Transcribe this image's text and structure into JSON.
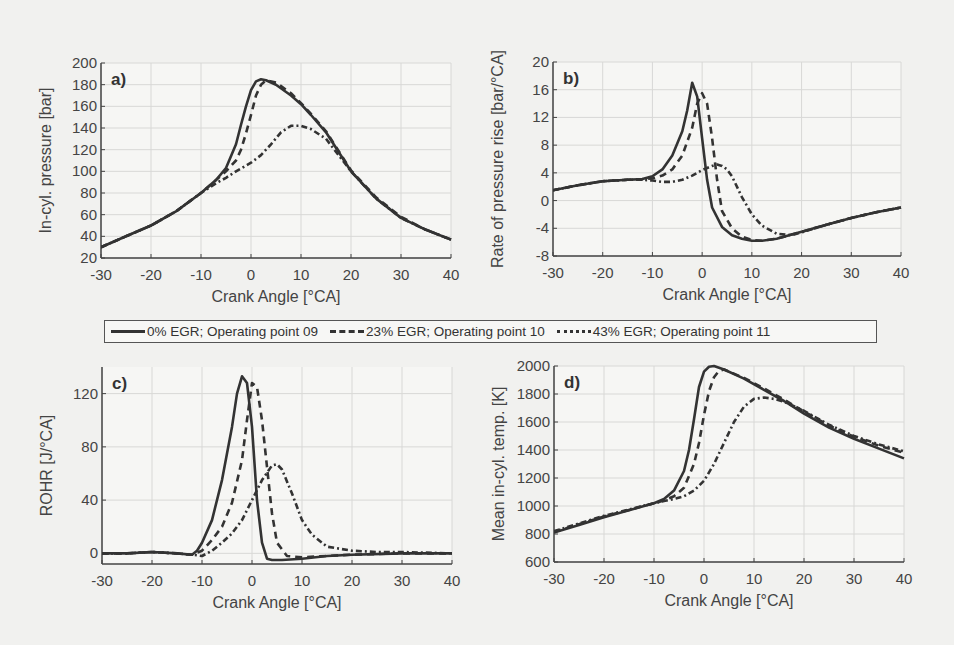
{
  "legend": {
    "items": [
      {
        "label": "0% EGR; Operating point 09",
        "style": "solid"
      },
      {
        "label": "23% EGR; Operating point 10",
        "style": "dashed"
      },
      {
        "label": "43% EGR; Operating point 11",
        "style": "dashdot"
      }
    ]
  },
  "chart_data": [
    {
      "type": "line",
      "panel_label": "a)",
      "title": "",
      "xlabel": "Crank Angle [°CA]",
      "ylabel": "In-cyl. pressure [bar]",
      "xlim": [
        -30,
        40
      ],
      "ylim": [
        20,
        200
      ],
      "xticks": [
        -30,
        -20,
        -10,
        0,
        10,
        20,
        30,
        40
      ],
      "yticks": [
        20,
        40,
        60,
        80,
        100,
        120,
        140,
        160,
        180,
        200
      ],
      "grid": true,
      "box": {
        "left": 101,
        "top": 63,
        "right": 451,
        "bottom": 258
      },
      "series": [
        {
          "name": "0% EGR; Operating point 09",
          "style": "solid",
          "x": [
            -30,
            -25,
            -20,
            -15,
            -10,
            -7,
            -5,
            -3,
            -2,
            -1,
            0,
            1,
            2,
            3,
            5,
            8,
            10,
            12,
            15,
            20,
            25,
            30,
            35,
            40
          ],
          "y": [
            30,
            40,
            50,
            63,
            80,
            92,
            103,
            125,
            143,
            160,
            175,
            183,
            185,
            184,
            180,
            170,
            162,
            152,
            136,
            100,
            75,
            57,
            46,
            37
          ]
        },
        {
          "name": "23% EGR; Operating point 10",
          "style": "dashed",
          "x": [
            -30,
            -25,
            -20,
            -15,
            -10,
            -7,
            -5,
            -3,
            -2,
            -1,
            0,
            1,
            2,
            3,
            5,
            8,
            10,
            12,
            15,
            20,
            25,
            30,
            35,
            40
          ],
          "y": [
            30,
            40,
            50,
            63,
            80,
            92,
            100,
            110,
            120,
            135,
            152,
            170,
            180,
            184,
            182,
            172,
            163,
            153,
            137,
            101,
            76,
            58,
            46,
            37
          ]
        },
        {
          "name": "43% EGR; Operating point 11",
          "style": "dashdot",
          "x": [
            -30,
            -25,
            -20,
            -15,
            -10,
            -7,
            -5,
            -3,
            0,
            2,
            4,
            6,
            8,
            10,
            12,
            15,
            20,
            25,
            30,
            35,
            40
          ],
          "y": [
            30,
            40,
            50,
            63,
            80,
            89,
            94,
            100,
            108,
            115,
            125,
            136,
            142,
            142,
            139,
            130,
            100,
            75,
            57,
            46,
            37
          ]
        }
      ]
    },
    {
      "type": "line",
      "panel_label": "b)",
      "title": "",
      "xlabel": "Crank Angle [°CA]",
      "ylabel": "Rate of pressure rise [bar/°CA]",
      "xlim": [
        -30,
        40
      ],
      "ylim": [
        -8,
        20
      ],
      "xticks": [
        -30,
        -20,
        -10,
        0,
        10,
        20,
        30,
        40
      ],
      "yticks": [
        -8,
        -4,
        0,
        4,
        8,
        12,
        16,
        20
      ],
      "grid": true,
      "box": {
        "left": 553,
        "top": 62,
        "right": 901,
        "bottom": 256
      },
      "series": [
        {
          "name": "0% EGR; Operating point 09",
          "style": "solid",
          "x": [
            -30,
            -25,
            -20,
            -15,
            -12,
            -10,
            -8,
            -6,
            -4,
            -3,
            -2,
            -1,
            0,
            1,
            2,
            4,
            6,
            8,
            10,
            12,
            15,
            20,
            25,
            30,
            35,
            40
          ],
          "y": [
            1.5,
            2.2,
            2.8,
            3.0,
            3.1,
            3.5,
            4.5,
            6.5,
            10,
            13,
            17,
            15,
            9,
            3,
            -1,
            -3.8,
            -5,
            -5.5,
            -5.8,
            -5.8,
            -5.5,
            -4.5,
            -3.5,
            -2.5,
            -1.7,
            -1
          ]
        },
        {
          "name": "23% EGR; Operating point 10",
          "style": "dashed",
          "x": [
            -30,
            -25,
            -20,
            -15,
            -12,
            -10,
            -8,
            -6,
            -4,
            -2,
            -1,
            0,
            1,
            2,
            3,
            4,
            6,
            8,
            10,
            12,
            15,
            20,
            25,
            30,
            35,
            40
          ],
          "y": [
            1.5,
            2.2,
            2.8,
            3.0,
            3.1,
            3.2,
            3.6,
            4.5,
            6.5,
            10.5,
            14,
            15.5,
            14,
            9,
            3,
            -1.5,
            -4,
            -5.2,
            -5.7,
            -5.8,
            -5.5,
            -4.5,
            -3.5,
            -2.5,
            -1.7,
            -1
          ]
        },
        {
          "name": "43% EGR; Operating point 11",
          "style": "dashdot",
          "x": [
            -30,
            -25,
            -20,
            -15,
            -12,
            -10,
            -8,
            -6,
            -4,
            -2,
            0,
            2,
            3,
            4,
            5,
            6,
            8,
            10,
            12,
            15,
            18,
            20,
            25,
            30,
            35,
            40
          ],
          "y": [
            1.5,
            2.2,
            2.8,
            3.0,
            3.0,
            2.9,
            2.7,
            2.7,
            3.0,
            3.6,
            4.4,
            5.0,
            5.2,
            5.0,
            4.5,
            3.5,
            0.5,
            -2,
            -3.6,
            -4.8,
            -5,
            -4.6,
            -3.5,
            -2.5,
            -1.7,
            -1
          ]
        }
      ]
    },
    {
      "type": "line",
      "panel_label": "c)",
      "title": "",
      "xlabel": "Crank Angle [°CA]",
      "ylabel": "ROHR [J/°CA]",
      "xlim": [
        -30,
        40
      ],
      "ylim": [
        -8,
        140
      ],
      "xticks": [
        -30,
        -20,
        -10,
        0,
        10,
        20,
        30,
        40
      ],
      "yticks": [
        0,
        40,
        80,
        120
      ],
      "grid": true,
      "box": {
        "left": 102,
        "top": 367,
        "right": 452,
        "bottom": 564
      },
      "series": [
        {
          "name": "0% EGR; Operating point 09",
          "style": "solid",
          "x": [
            -30,
            -25,
            -20,
            -15,
            -12,
            -11,
            -10,
            -8,
            -6,
            -4,
            -3,
            -2,
            -1,
            0,
            1,
            2,
            3,
            4,
            6,
            10,
            15,
            20,
            30,
            40
          ],
          "y": [
            0,
            0,
            1,
            0,
            -1,
            2,
            8,
            25,
            55,
            95,
            120,
            133,
            128,
            95,
            40,
            8,
            -4,
            -5,
            -5,
            -4,
            -2,
            -1,
            0,
            0
          ]
        },
        {
          "name": "23% EGR; Operating point 10",
          "style": "dashed",
          "x": [
            -30,
            -25,
            -20,
            -15,
            -12,
            -10,
            -8,
            -6,
            -4,
            -2,
            -1,
            0,
            1,
            2,
            3,
            4,
            5,
            7,
            10,
            15,
            20,
            30,
            40
          ],
          "y": [
            0,
            0,
            1,
            0,
            -1,
            2,
            10,
            20,
            38,
            70,
            100,
            128,
            125,
            100,
            65,
            30,
            8,
            -2,
            -3,
            -2,
            -1,
            0,
            0
          ]
        },
        {
          "name": "43% EGR; Operating point 11",
          "style": "dashdot",
          "x": [
            -30,
            -25,
            -20,
            -15,
            -12,
            -10,
            -8,
            -6,
            -4,
            -2,
            0,
            2,
            4,
            5,
            6,
            8,
            10,
            12,
            15,
            20,
            25,
            30,
            40
          ],
          "y": [
            0,
            0,
            1,
            0,
            -1,
            -2,
            2,
            8,
            15,
            25,
            40,
            55,
            66,
            67,
            63,
            45,
            25,
            14,
            5,
            2,
            1,
            1,
            0
          ]
        }
      ]
    },
    {
      "type": "line",
      "panel_label": "d)",
      "title": "",
      "xlabel": "Crank Angle [°CA]",
      "ylabel": "Mean in-cyl. temp. [K]",
      "xlim": [
        -30,
        40
      ],
      "ylim": [
        600,
        2000
      ],
      "xticks": [
        -30,
        -20,
        -10,
        0,
        10,
        20,
        30,
        40
      ],
      "yticks": [
        600,
        800,
        1000,
        1200,
        1400,
        1600,
        1800,
        2000
      ],
      "grid": true,
      "box": {
        "left": 554,
        "top": 366,
        "right": 904,
        "bottom": 562
      },
      "series": [
        {
          "name": "0% EGR; Operating point 09",
          "style": "solid",
          "x": [
            -30,
            -25,
            -20,
            -15,
            -10,
            -8,
            -6,
            -4,
            -3,
            -2,
            -1,
            0,
            1,
            2,
            4,
            8,
            12,
            16,
            20,
            25,
            30,
            35,
            40
          ],
          "y": [
            810,
            865,
            920,
            970,
            1020,
            1050,
            1110,
            1250,
            1400,
            1620,
            1850,
            1960,
            1995,
            2000,
            1975,
            1910,
            1830,
            1750,
            1660,
            1560,
            1480,
            1410,
            1340
          ]
        },
        {
          "name": "23% EGR; Operating point 10",
          "style": "dashed",
          "x": [
            -30,
            -25,
            -20,
            -15,
            -10,
            -8,
            -6,
            -4,
            -2,
            -1,
            0,
            1,
            2,
            3,
            4,
            8,
            12,
            16,
            20,
            25,
            30,
            35,
            40
          ],
          "y": [
            815,
            870,
            925,
            972,
            1020,
            1040,
            1070,
            1130,
            1300,
            1450,
            1650,
            1820,
            1920,
            1965,
            1975,
            1915,
            1840,
            1760,
            1675,
            1575,
            1495,
            1430,
            1380
          ]
        },
        {
          "name": "43% EGR; Operating point 11",
          "style": "dashdot",
          "x": [
            -30,
            -25,
            -20,
            -15,
            -10,
            -8,
            -6,
            -4,
            -2,
            0,
            2,
            4,
            6,
            8,
            10,
            12,
            14,
            16,
            20,
            25,
            30,
            35,
            40
          ],
          "y": [
            820,
            875,
            930,
            975,
            1020,
            1035,
            1050,
            1070,
            1110,
            1180,
            1300,
            1450,
            1600,
            1710,
            1765,
            1775,
            1765,
            1745,
            1680,
            1580,
            1500,
            1440,
            1390
          ]
        }
      ]
    }
  ]
}
